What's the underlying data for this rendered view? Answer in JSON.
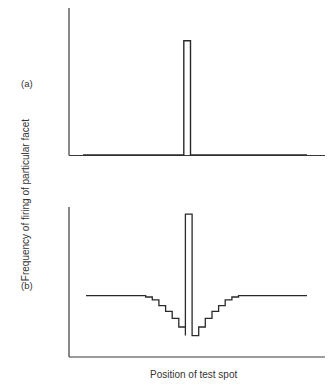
{
  "chart_data": [
    {
      "panel": "(a)",
      "type": "line",
      "title": "",
      "xlabel": "Position of test spot",
      "ylabel": "Frequency of firing of particular facet",
      "grid": false,
      "legend": null,
      "x": [
        0,
        0.45,
        0.45,
        0.48,
        0.48,
        1
      ],
      "values": [
        0,
        0,
        1,
        1,
        0,
        0
      ],
      "annotations": [
        "Single narrow peak at central position; zero firing elsewhere"
      ],
      "ylim": [
        0,
        1.05
      ],
      "xlim": [
        0,
        1
      ]
    },
    {
      "panel": "(b)",
      "type": "line",
      "title": "",
      "xlabel": "Position of test spot",
      "ylabel": "Frequency of firing of particular facet",
      "grid": false,
      "legend": null,
      "x": [
        0,
        0.24,
        0.27,
        0.3,
        0.33,
        0.36,
        0.39,
        0.42,
        0.45,
        0.45,
        0.48,
        0.48,
        0.51,
        0.54,
        0.57,
        0.6,
        0.63,
        0.66,
        0.69,
        1
      ],
      "values": [
        0.43,
        0.43,
        0.42,
        0.4,
        0.36,
        0.32,
        0.27,
        0.21,
        0.15,
        1.0,
        1.0,
        0.15,
        0.21,
        0.27,
        0.32,
        0.36,
        0.4,
        0.42,
        0.43,
        0.43
      ],
      "annotations": [
        "Central peak flanked by stepwise inhibitory dip (lateral inhibition) returning to plateau"
      ],
      "ylim": [
        0,
        1.05
      ],
      "xlim": [
        0,
        1
      ]
    }
  ],
  "labels": {
    "panel_a": "(a)",
    "panel_b": "(b)",
    "ylabel": "Frequency of firing of particular facet",
    "xlabel": "Position of test spot"
  },
  "colors": {
    "line": "#2a2a2a",
    "background": "#ffffff"
  }
}
